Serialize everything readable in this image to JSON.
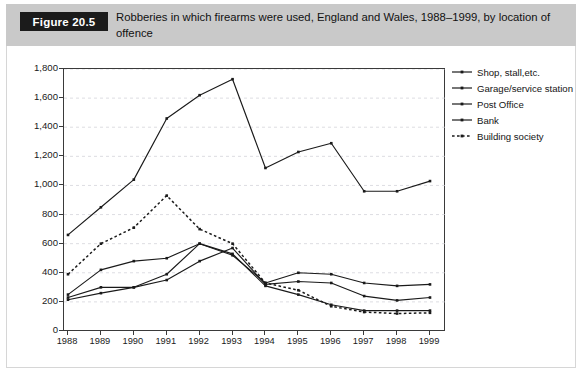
{
  "figure": {
    "tag": "Figure 20.5",
    "caption": "Robberies in which firearms were used, England and Wales, 1988–1999, by location of offence"
  },
  "chart_data": {
    "type": "line",
    "title": "Robberies in which firearms were used, England and Wales, 1988–1999, by location of offence",
    "xlabel": "",
    "ylabel": "",
    "x": [
      1988,
      1989,
      1990,
      1991,
      1992,
      1993,
      1994,
      1995,
      1996,
      1997,
      1998,
      1999
    ],
    "xtick_labels": [
      "1988",
      "1989",
      "1990",
      "1991",
      "1992",
      "1993",
      "1994",
      "1995",
      "1996",
      "1997",
      "1998",
      "1999"
    ],
    "ytick_labels": [
      "0",
      "200",
      "400",
      "600",
      "800",
      "1,000",
      "1,200",
      "1,400",
      "1,600",
      "1,800"
    ],
    "yticks": [
      0,
      200,
      400,
      600,
      800,
      1000,
      1200,
      1400,
      1600,
      1800
    ],
    "ylim": [
      0,
      1800
    ],
    "grid": true,
    "legend_position": "right",
    "series": [
      {
        "name": "Shop, stall,etc.",
        "style": "solid",
        "color": "#1a1a1a",
        "values": [
          660,
          850,
          1040,
          1460,
          1620,
          1730,
          1120,
          1230,
          1290,
          960,
          960,
          1030
        ]
      },
      {
        "name": "Garage/service station",
        "style": "solid",
        "color": "#1a1a1a",
        "values": [
          250,
          420,
          480,
          500,
          600,
          520,
          330,
          400,
          390,
          330,
          310,
          320
        ]
      },
      {
        "name": "Post Office",
        "style": "solid",
        "color": "#1a1a1a",
        "values": [
          230,
          300,
          300,
          350,
          480,
          570,
          320,
          340,
          330,
          240,
          210,
          230
        ]
      },
      {
        "name": "Bank",
        "style": "solid",
        "color": "#1a1a1a",
        "values": [
          215,
          260,
          300,
          390,
          600,
          530,
          310,
          250,
          180,
          140,
          140,
          140
        ]
      },
      {
        "name": "Building society",
        "style": "dotted",
        "color": "#1a1a1a",
        "values": [
          390,
          600,
          710,
          930,
          700,
          600,
          330,
          280,
          170,
          130,
          120,
          125
        ]
      }
    ]
  },
  "legend": {
    "items": [
      {
        "label": "Shop, stall,etc.",
        "style": "solid"
      },
      {
        "label": "Garage/service station",
        "style": "solid"
      },
      {
        "label": "Post Office",
        "style": "solid"
      },
      {
        "label": "Bank",
        "style": "solid"
      },
      {
        "label": "Building society",
        "style": "dotted"
      }
    ]
  }
}
